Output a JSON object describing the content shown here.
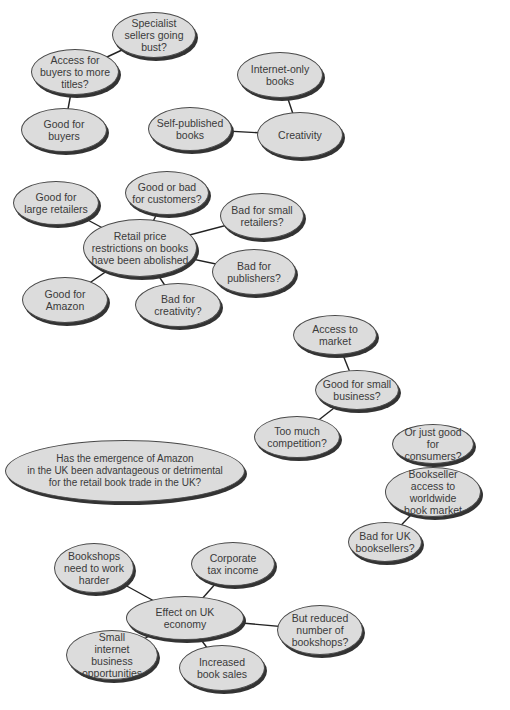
{
  "diagram": {
    "type": "mind-map",
    "colors": {
      "node_fill": "#dcdcdc",
      "node_border": "#4a4a4a",
      "node_shadow": "#333333",
      "text": "#3a3a3a",
      "link": "#222222",
      "background": "#ffffff"
    },
    "nodes": [
      {
        "id": "specialist",
        "label": "Specialist\nsellers going\nbust?",
        "cx": 154,
        "cy": 35,
        "w": 84,
        "h": 46
      },
      {
        "id": "access_titles",
        "label": "Access for\nbuyers to more\ntitles?",
        "cx": 75,
        "cy": 72,
        "w": 88,
        "h": 46
      },
      {
        "id": "good_buyers",
        "label": "Good for\nbuyers",
        "cx": 64,
        "cy": 130,
        "w": 86,
        "h": 44
      },
      {
        "id": "internet_only",
        "label": "Internet-only\nbooks",
        "cx": 280,
        "cy": 75,
        "w": 86,
        "h": 46
      },
      {
        "id": "self_published",
        "label": "Self-published\nbooks",
        "cx": 190,
        "cy": 129,
        "w": 84,
        "h": 44
      },
      {
        "id": "creativity",
        "label": "Creativity",
        "cx": 300,
        "cy": 135,
        "w": 86,
        "h": 46
      },
      {
        "id": "good_bad_customers",
        "label": "Good  or bad\nfor customers?",
        "cx": 167,
        "cy": 193,
        "w": 84,
        "h": 44
      },
      {
        "id": "good_large_retailers",
        "label": "Good for\nlarge retailers",
        "cx": 56,
        "cy": 203,
        "w": 86,
        "h": 44
      },
      {
        "id": "bad_small_retailers",
        "label": "Bad for small\nretailers?",
        "cx": 262,
        "cy": 216,
        "w": 84,
        "h": 46
      },
      {
        "id": "retail_price",
        "label": "Retail price\nrestrictions on books\nhave been abolished",
        "cx": 140,
        "cy": 248,
        "w": 114,
        "h": 58,
        "central": true
      },
      {
        "id": "bad_publishers",
        "label": "Bad for\npublishers?",
        "cx": 254,
        "cy": 272,
        "w": 84,
        "h": 46
      },
      {
        "id": "good_amazon",
        "label": "Good for\nAmazon",
        "cx": 65,
        "cy": 300,
        "w": 86,
        "h": 46
      },
      {
        "id": "bad_creativity",
        "label": "Bad for\ncreativity?",
        "cx": 178,
        "cy": 305,
        "w": 86,
        "h": 44
      },
      {
        "id": "access_market",
        "label": "Access to\nmarket",
        "cx": 335,
        "cy": 335,
        "w": 84,
        "h": 40
      },
      {
        "id": "good_small_business",
        "label": "Good for small\nbusiness?",
        "cx": 357,
        "cy": 390,
        "w": 84,
        "h": 40
      },
      {
        "id": "too_much_competition",
        "label": "Too much\ncompetition?",
        "cx": 297,
        "cy": 437,
        "w": 86,
        "h": 42
      },
      {
        "id": "good_consumers",
        "label": "Or just good\nfor consumers?",
        "cx": 433,
        "cy": 444,
        "w": 82,
        "h": 40
      },
      {
        "id": "main_question",
        "label": "Has the emergence of Amazon\nin the UK been advantageous or detrimental\nfor the retail book trade in the UK?",
        "cx": 125,
        "cy": 471,
        "w": 240,
        "h": 62,
        "question": true
      },
      {
        "id": "bookseller_access",
        "label": "Bookseller\naccess to worldwide\nbook market",
        "cx": 433,
        "cy": 492,
        "w": 96,
        "h": 50
      },
      {
        "id": "bad_uk_booksellers",
        "label": "Bad for UK\nbooksellers?",
        "cx": 385,
        "cy": 542,
        "w": 74,
        "h": 40
      },
      {
        "id": "bookshops_harder",
        "label": "Bookshops\nneed to work\nharder",
        "cx": 94,
        "cy": 568,
        "w": 80,
        "h": 50
      },
      {
        "id": "corporate_tax",
        "label": "Corporate\ntax income",
        "cx": 233,
        "cy": 564,
        "w": 84,
        "h": 44
      },
      {
        "id": "uk_economy",
        "label": "Effect on UK economy",
        "cx": 185,
        "cy": 618,
        "w": 118,
        "h": 44,
        "central": true
      },
      {
        "id": "reduced_bookshops",
        "label": "But reduced\nnumber of\nbookshops?",
        "cx": 320,
        "cy": 630,
        "w": 86,
        "h": 50
      },
      {
        "id": "small_internet",
        "label": "Small\ninternet business\nopportunities",
        "cx": 112,
        "cy": 655,
        "w": 92,
        "h": 50
      },
      {
        "id": "increased_sales",
        "label": "Increased\nbook sales",
        "cx": 222,
        "cy": 668,
        "w": 86,
        "h": 46
      }
    ],
    "links": [
      [
        "specialist",
        "access_titles"
      ],
      [
        "access_titles",
        "good_buyers"
      ],
      [
        "internet_only",
        "creativity"
      ],
      [
        "self_published",
        "creativity"
      ],
      [
        "retail_price",
        "good_bad_customers"
      ],
      [
        "retail_price",
        "good_large_retailers"
      ],
      [
        "retail_price",
        "bad_small_retailers"
      ],
      [
        "retail_price",
        "bad_publishers"
      ],
      [
        "retail_price",
        "good_amazon"
      ],
      [
        "retail_price",
        "bad_creativity"
      ],
      [
        "access_market",
        "good_small_business"
      ],
      [
        "good_small_business",
        "too_much_competition"
      ],
      [
        "good_consumers",
        "bookseller_access"
      ],
      [
        "bookseller_access",
        "bad_uk_booksellers"
      ],
      [
        "uk_economy",
        "bookshops_harder"
      ],
      [
        "uk_economy",
        "corporate_tax"
      ],
      [
        "uk_economy",
        "reduced_bookshops"
      ],
      [
        "uk_economy",
        "small_internet"
      ],
      [
        "uk_economy",
        "increased_sales"
      ]
    ]
  }
}
